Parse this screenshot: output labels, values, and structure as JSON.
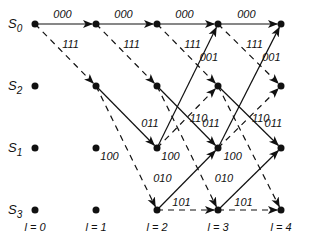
{
  "diagram": {
    "type": "trellis",
    "states": [
      {
        "name": "S",
        "sub": "0",
        "row": 0
      },
      {
        "name": "S",
        "sub": "2",
        "row": 1
      },
      {
        "name": "S",
        "sub": "1",
        "row": 2
      },
      {
        "name": "S",
        "sub": "3",
        "row": 3
      }
    ],
    "time_labels": [
      "l = 0",
      "l = 1",
      "l = 2",
      "l = 3",
      "l = 4"
    ],
    "transitions": [
      {
        "from": "S0",
        "to": "S0",
        "output": "000",
        "style": "solid"
      },
      {
        "from": "S0",
        "to": "S2",
        "output": "111",
        "style": "dashed"
      },
      {
        "from": "S2",
        "to": "S1",
        "output": "011",
        "style": "solid"
      },
      {
        "from": "S2",
        "to": "S3",
        "output": "100",
        "style": "dashed"
      },
      {
        "from": "S1",
        "to": "S0",
        "output": "001",
        "style": "solid"
      },
      {
        "from": "S1",
        "to": "S2",
        "output": "110",
        "style": "dashed"
      },
      {
        "from": "S3",
        "to": "S1",
        "output": "010",
        "style": "solid"
      },
      {
        "from": "S3",
        "to": "S3",
        "output": "101",
        "style": "dashed"
      }
    ],
    "colors": {
      "line": "#111111",
      "background": "#ffffff"
    }
  }
}
